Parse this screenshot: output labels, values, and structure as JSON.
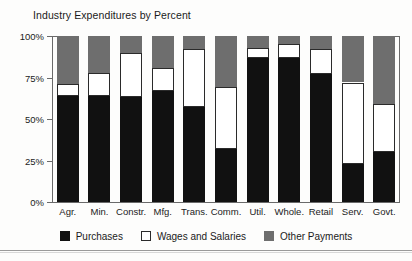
{
  "chart_data": {
    "type": "bar",
    "title": "Industry Expenditures by Percent",
    "subtitle": "",
    "xlabel": "",
    "ylabel": "",
    "stacked": true,
    "stack_normalized": true,
    "grid": false,
    "legend_position": "bottom",
    "ylim": [
      0,
      100
    ],
    "yticks": [
      0,
      25,
      50,
      75,
      100
    ],
    "ytick_labels": [
      "0%",
      "25%",
      "50%",
      "75%",
      "100%"
    ],
    "categories": [
      "Agr.",
      "Min.",
      "Constr.",
      "Mfg.",
      "Trans.",
      "Comm.",
      "Util.",
      "Whole.",
      "Retail",
      "Serv.",
      "Govt."
    ],
    "series": [
      {
        "name": "Purchases",
        "color": "#111111",
        "values": [
          64,
          64,
          63,
          67,
          57,
          32,
          87,
          87,
          77,
          23,
          30
        ]
      },
      {
        "name": "Wages and Salaries",
        "color": "#ffffff",
        "values": [
          7,
          14,
          27,
          14,
          35,
          37,
          6,
          8,
          15,
          49,
          29
        ]
      },
      {
        "name": "Other Payments",
        "color": "#6e6e6e",
        "values": [
          29,
          22,
          10,
          19,
          8,
          31,
          7,
          5,
          8,
          28,
          41
        ]
      }
    ]
  },
  "legend": {
    "items": [
      {
        "label": "Purchases",
        "swatch": "solid-black-square-icon"
      },
      {
        "label": "Wages and Salaries",
        "swatch": "outlined-white-square-icon"
      },
      {
        "label": "Other Payments",
        "swatch": "solid-gray-square-icon"
      }
    ]
  },
  "colors": {
    "purchases": "#111111",
    "wages": "#ffffff",
    "other_payments": "#6e6e6e",
    "axis": "#6a6a6a",
    "background": "#fdfdfc",
    "text": "#1b1b1b"
  }
}
